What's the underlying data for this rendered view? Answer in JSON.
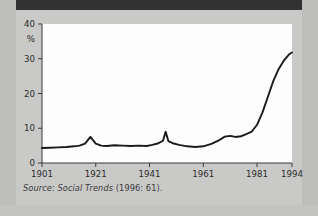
{
  "figure": {
    "caption_source_label": "Source:",
    "caption_title": "Social Trends",
    "caption_citation": "(1996: 61)."
  },
  "chart_data": {
    "type": "line",
    "title": "",
    "xlabel": "",
    "ylabel": "%",
    "xlim": [
      1901,
      1994
    ],
    "ylim": [
      0,
      40
    ],
    "grid": false,
    "legend": false,
    "xticks": [
      1901,
      1921,
      1941,
      1961,
      1981,
      1994
    ],
    "xtick_labels": [
      "1901",
      "1921",
      "1941",
      "1961",
      "1981",
      "1994"
    ],
    "yticks": [
      0,
      10,
      20,
      30,
      40
    ],
    "ytick_labels": [
      "0",
      "10",
      "20",
      "30",
      "40"
    ],
    "series": [
      {
        "name": "percentage",
        "x": [
          1901,
          1904,
          1907,
          1910,
          1913,
          1915,
          1917,
          1919,
          1921,
          1923,
          1925,
          1928,
          1931,
          1934,
          1937,
          1940,
          1942,
          1944,
          1946,
          1947,
          1948,
          1950,
          1952,
          1955,
          1958,
          1961,
          1964,
          1967,
          1969,
          1971,
          1973,
          1975,
          1977,
          1979,
          1981,
          1983,
          1985,
          1987,
          1989,
          1991,
          1993,
          1994
        ],
        "values": [
          4.3,
          4.4,
          4.5,
          4.6,
          4.8,
          5.0,
          5.6,
          7.5,
          5.6,
          5.0,
          4.9,
          5.1,
          5.0,
          4.9,
          5.0,
          4.9,
          5.2,
          5.6,
          6.4,
          9.0,
          6.3,
          5.6,
          5.2,
          4.8,
          4.6,
          4.8,
          5.5,
          6.6,
          7.6,
          7.8,
          7.5,
          7.7,
          8.3,
          9.0,
          11.0,
          14.5,
          19.0,
          23.5,
          27.0,
          29.5,
          31.3,
          31.8
        ]
      }
    ]
  }
}
